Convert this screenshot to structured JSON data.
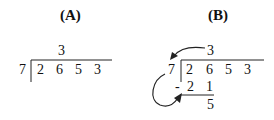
{
  "panelA": {
    "title": "(A)",
    "divisor": "7",
    "dividend": [
      "2",
      "6",
      "5",
      "3"
    ],
    "quotient": [
      "3"
    ]
  },
  "panelB": {
    "title": "(B)",
    "divisor": "7",
    "dividend": [
      "2",
      "6",
      "5",
      "3"
    ],
    "quotient": [
      "3"
    ],
    "minus_sign": "-",
    "product": [
      "2",
      "1"
    ],
    "remainder": "5",
    "arrows": [
      "quotient-to-divisor",
      "divisor-to-product"
    ]
  }
}
